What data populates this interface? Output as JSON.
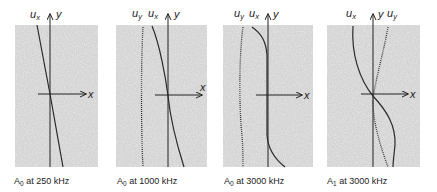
{
  "figure": {
    "panels": [
      {
        "caption_mode": "A",
        "caption_mode_sub": "0",
        "caption_rest": " at 250 kHz",
        "labels": {
          "ux": "u",
          "ux_sub": "x",
          "y": "y",
          "x": "x"
        }
      },
      {
        "caption_mode": "A",
        "caption_mode_sub": "0",
        "caption_rest": " at 1000 kHz",
        "labels": {
          "uy": "u",
          "uy_sub": "y",
          "ux": "u",
          "ux_sub": "x",
          "y": "y",
          "x": "x"
        }
      },
      {
        "caption_mode": "A",
        "caption_mode_sub": "0",
        "caption_rest": " at 3000 kHz",
        "labels": {
          "uy": "u",
          "uy_sub": "y",
          "ux": "u",
          "ux_sub": "x",
          "y": "y",
          "x": "x"
        }
      },
      {
        "caption_mode": "A",
        "caption_mode_sub": "1",
        "caption_rest": " at 3000 kHz",
        "labels": {
          "ux": "u",
          "ux_sub": "x",
          "y": "y",
          "uy": "u",
          "uy_sub": "y",
          "x": "x"
        }
      }
    ],
    "legend_semantics": {
      "solid_line": "u_x displacement profile",
      "dotted_line": "u_y displacement profile"
    },
    "colors": {
      "panel_fill": "#c8c8c8",
      "line": "#2a2a2a",
      "background": "#ffffff"
    }
  }
}
